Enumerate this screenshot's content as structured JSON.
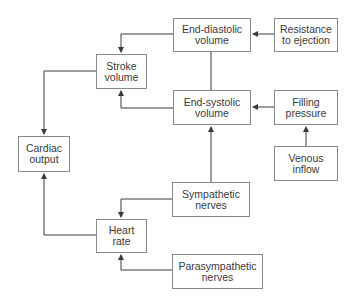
{
  "diagram": {
    "nodes": {
      "end_diastolic_volume": {
        "label": "End-diastolic\nvolume"
      },
      "resistance_to_ejection": {
        "label": "Resistance\nto ejection"
      },
      "stroke_volume": {
        "label": "Stroke\nvolume"
      },
      "end_systolic_volume": {
        "label": "End-systolic\nvolume"
      },
      "filling_pressure": {
        "label": "Filling\npressure"
      },
      "cardiac_output": {
        "label": "Cardiac\noutput"
      },
      "venous_inflow": {
        "label": "Venous\ninflow"
      },
      "sympathetic_nerves": {
        "label": "Sympathetic\nnerves"
      },
      "heart_rate": {
        "label": "Heart\nrate"
      },
      "parasympathetic_nerves": {
        "label": "Parasympathetic\nnerves"
      }
    },
    "edges": [
      {
        "from": "Resistance to ejection",
        "to": "End-diastolic volume"
      },
      {
        "from": "End-diastolic volume",
        "to": "Stroke volume"
      },
      {
        "from": "End-diastolic volume",
        "to": "End-systolic volume",
        "type": "line"
      },
      {
        "from": "End-systolic volume",
        "to": "Stroke volume"
      },
      {
        "from": "Filling pressure",
        "to": "End-systolic volume"
      },
      {
        "from": "Venous inflow",
        "to": "Filling pressure"
      },
      {
        "from": "Stroke volume",
        "to": "Cardiac output"
      },
      {
        "from": "Sympathetic nerves",
        "to": "End-systolic volume"
      },
      {
        "from": "Sympathetic nerves",
        "to": "Heart rate"
      },
      {
        "from": "Parasympathetic nerves",
        "to": "Heart rate"
      },
      {
        "from": "Heart rate",
        "to": "Cardiac output"
      }
    ],
    "colors": {
      "line": "#3a3a3a",
      "border": "#8a8a8a",
      "text": "#3a3a3a"
    }
  }
}
